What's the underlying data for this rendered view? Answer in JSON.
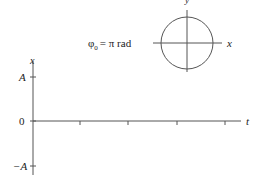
{
  "phasor": {
    "phase_label_symbol": "φ",
    "phase_label_subscript": "0",
    "phase_label_rest": "= π rad",
    "x_axis_label": "x",
    "y_axis_label": "y"
  },
  "graph": {
    "vertical_axis_label": "x",
    "horizontal_axis_label": "t",
    "tick_labels": {
      "top": "A",
      "zero": "0",
      "bottom": "−A"
    },
    "time_ticks": 4
  },
  "colors": {
    "line": "#555555",
    "text": "#222222"
  }
}
